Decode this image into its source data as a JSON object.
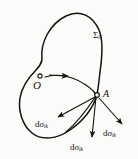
{
  "figure": {
    "type": "geometry-diagram",
    "background_color": "#fbfbfa",
    "ink_color": "#14120f",
    "width": 138,
    "height": 159,
    "surface": {
      "label_symbol": "Σ",
      "label_subscript": "9",
      "description": "closed-region-boundary"
    },
    "points": [
      {
        "id": "O",
        "label": "O",
        "x": 40,
        "y": 77,
        "marker": "open-circle",
        "role": "interior-reference-point"
      },
      {
        "id": "A",
        "label": "A",
        "x": 97,
        "y": 95,
        "marker": "open-circle",
        "role": "boundary-point"
      }
    ],
    "connector": {
      "from": "O",
      "to": "A",
      "style": "curved-arrow",
      "arrowhead": "mid"
    },
    "vectors": [
      {
        "id": "dsigma-left",
        "label_d": "d",
        "label_sigma": "σ",
        "label_subscript": "ik",
        "from_x": 97,
        "from_y": 95,
        "to_x": 56,
        "to_y": 118,
        "direction": "lower-left"
      },
      {
        "id": "dsigma-bottom",
        "label_d": "d",
        "label_sigma": "σ",
        "label_subscript": "ik",
        "from_x": 97,
        "from_y": 95,
        "to_x": 92,
        "to_y": 139,
        "direction": "down"
      },
      {
        "id": "dsigma-right",
        "label_d": "d",
        "label_sigma": "σ",
        "label_subscript": "ik",
        "from_x": 97,
        "from_y": 95,
        "to_x": 124,
        "to_y": 126,
        "direction": "lower-right"
      }
    ]
  }
}
